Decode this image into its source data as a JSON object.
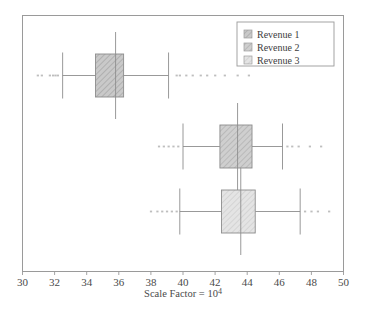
{
  "chart_data": {
    "type": "box",
    "orientation": "horizontal",
    "title": "",
    "xlabel": "Scale Factor = 10^4",
    "xlabel_base": "Scale Factor = 10",
    "xlabel_exponent": "4",
    "ylabel": "",
    "xlim": [
      30,
      50
    ],
    "xticks": [
      30,
      32,
      34,
      36,
      38,
      40,
      42,
      44,
      46,
      48,
      50
    ],
    "xtick_labels": [
      "30",
      "32",
      "34",
      "36",
      "38",
      "40",
      "42",
      "44",
      "46",
      "48",
      "50"
    ],
    "grid": false,
    "legend_position": "top-right",
    "legend": [
      "Revenue 1",
      "Revenue 2",
      "Revenue 3"
    ],
    "series": [
      {
        "name": "Revenue 1",
        "color": "#b9b9b9",
        "hatch": "diagonal",
        "row": 1,
        "whisker_low": 32.5,
        "q1": 34.55,
        "median": 35.8,
        "q3": 36.3,
        "whisker_high": 39.1,
        "outliers_low": [
          30.95,
          31.2,
          31.7,
          31.9,
          32.05,
          32.2
        ],
        "outliers_high": [
          39.6,
          39.8,
          40.2,
          40.6,
          41.1,
          41.5,
          42.0,
          42.6,
          43.4,
          44.1
        ]
      },
      {
        "name": "Revenue 2",
        "color": "#c2c2c2",
        "hatch": "diagonal",
        "row": 2,
        "whisker_low": 40.0,
        "q1": 42.3,
        "median": 43.4,
        "q3": 44.3,
        "whisker_high": 46.2,
        "outliers_low": [
          38.5,
          38.8,
          39.1,
          39.4,
          39.7
        ],
        "outliers_high": [
          46.5,
          46.8,
          47.2,
          47.9,
          48.6
        ]
      },
      {
        "name": "Revenue 3",
        "color": "#dcdcdc",
        "hatch": "diagonal",
        "row": 3,
        "whisker_low": 39.8,
        "q1": 42.4,
        "median": 43.6,
        "q3": 44.5,
        "whisker_high": 47.3,
        "outliers_low": [
          38.0,
          38.4,
          38.7,
          39.0,
          39.3,
          39.6
        ],
        "outliers_high": [
          47.6,
          48.0,
          48.4,
          49.1
        ]
      }
    ]
  },
  "colors": {
    "frame": "#9a9a9a",
    "box_edge": "#8d8d8d",
    "whisker": "#8d8d8d",
    "median": "#8d8d8d",
    "outlier": "#a8a8a8",
    "legend_border": "#9a9a9a",
    "background": "#ffffff"
  }
}
